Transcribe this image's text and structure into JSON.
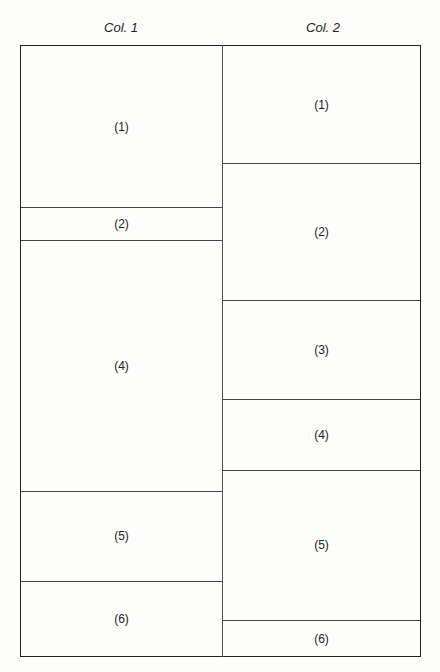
{
  "columns": [
    {
      "header": "Col. 1",
      "cells": [
        {
          "label": "(1)",
          "top": 46,
          "bottom": 207
        },
        {
          "label": "(2)",
          "top": 207,
          "bottom": 240
        },
        {
          "label": "(4)",
          "top": 240,
          "bottom": 491
        },
        {
          "label": "(5)",
          "top": 491,
          "bottom": 581
        },
        {
          "label": "(6)",
          "top": 581,
          "bottom": 657
        }
      ]
    },
    {
      "header": "Col. 2",
      "cells": [
        {
          "label": "(1)",
          "top": 46,
          "bottom": 163
        },
        {
          "label": "(2)",
          "top": 163,
          "bottom": 300
        },
        {
          "label": "(3)",
          "top": 300,
          "bottom": 399
        },
        {
          "label": "(4)",
          "top": 399,
          "bottom": 470
        },
        {
          "label": "(5)",
          "top": 470,
          "bottom": 620
        },
        {
          "label": "(6)",
          "top": 620,
          "bottom": 657
        }
      ]
    }
  ]
}
